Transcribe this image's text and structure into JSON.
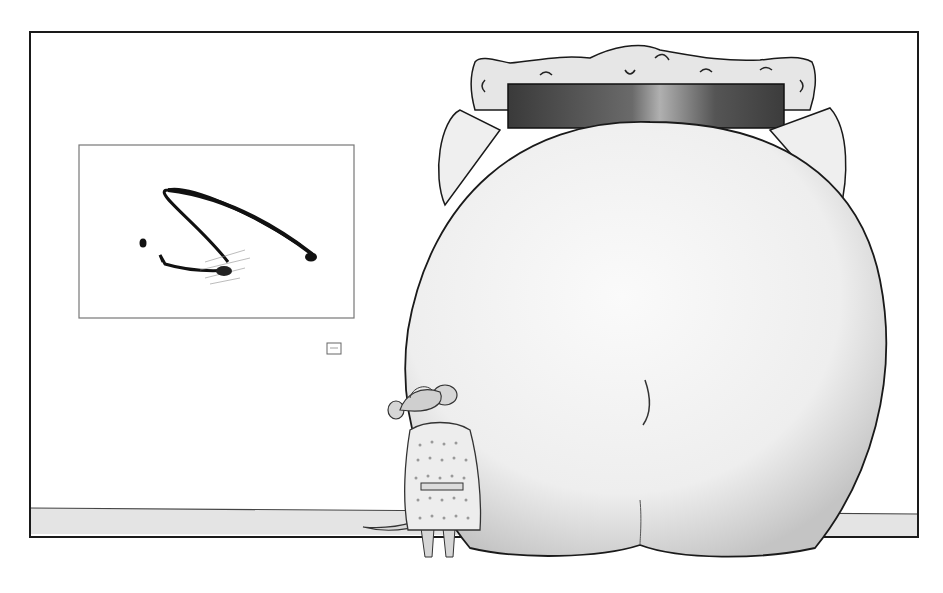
{
  "scene": {
    "description": "Cartoon: a small mouse in a trench coat and fedora stands in a gallery beside an enormous elephant rear whose body blocks an ornate framed painting, while an abstract ink painting hangs on the left wall",
    "colors": {
      "background": "#ffffff",
      "wall": "#ffffff",
      "floor": "#e6e6e6",
      "ink": "#1a1a1a",
      "elephant": "#f0f0f0",
      "elephant_shade": "#c8c8c8",
      "frame": "#e4e4e4",
      "dark_painting": "#4a4a4a",
      "coat": "#ececec",
      "mouse_skin": "#d6d6d6"
    },
    "left_painting": {
      "style": "abstract ink brushstroke"
    },
    "wall_label": {
      "glyph": "[=]"
    },
    "ornate_painting": {
      "style": "gilded baroque frame, dark canvas"
    },
    "mouse": {
      "outfit": "checked trench coat and fedora"
    }
  }
}
